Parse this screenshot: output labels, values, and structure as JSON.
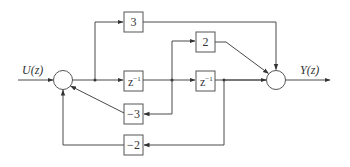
{
  "diagram": {
    "type": "block-diagram",
    "input": {
      "label": "U(z)"
    },
    "output": {
      "label": "Y(z)"
    },
    "blocks": [
      {
        "id": "gain-3",
        "label": "3"
      },
      {
        "id": "gain-2",
        "label": "2"
      },
      {
        "id": "delay-1",
        "label_base": "z",
        "label_exp": "−1"
      },
      {
        "id": "delay-2",
        "label_base": "z",
        "label_exp": "−1"
      },
      {
        "id": "gain-neg3",
        "label": "−3"
      },
      {
        "id": "gain-neg2",
        "label": "−2"
      }
    ],
    "summing_junctions": [
      {
        "id": "input-sum",
        "inputs": [
          "U(z)",
          "−3 feedback",
          "−2 feedback"
        ]
      },
      {
        "id": "output-sum",
        "inputs": [
          "3 feedforward",
          "2 feedforward",
          "delay-2 output"
        ]
      }
    ],
    "colors": {
      "line": "#4a4a4a",
      "background": "#ffffff"
    }
  }
}
